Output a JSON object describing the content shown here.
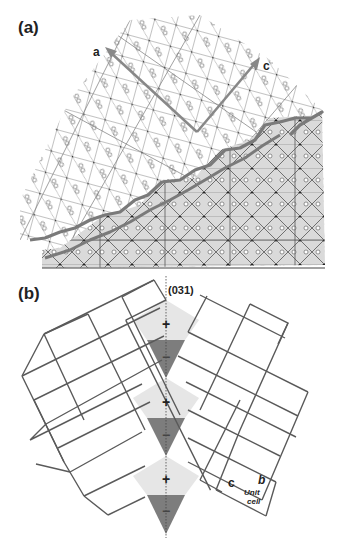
{
  "figure": {
    "panels": [
      {
        "id": "a",
        "label": "(a)",
        "axis_labels": {
          "a": "a",
          "c": "c"
        },
        "description": "Crystal structure projection with interface boundary (thick gray line); lower region shaded gray"
      },
      {
        "id": "b",
        "label": "(b)",
        "plane_label": "(031)",
        "signs": [
          "+",
          "−",
          "+",
          "−",
          "+",
          "−"
        ],
        "unit_cell": {
          "label_line1": "Unit",
          "label_line2": "cell",
          "axis_c": "c",
          "axis_b": "b"
        }
      }
    ],
    "colors": {
      "line": "#555555",
      "thick_line": "#7a7a7a",
      "shade_light": "#e6e6e6",
      "shade_dark": "#7d7d7d",
      "region_gray": "#d9d9d9"
    }
  }
}
